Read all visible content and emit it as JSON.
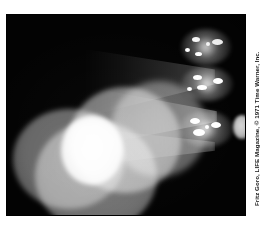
{
  "figure": {
    "name": "additive-color-mixing-photograph",
    "background_color": "#ffffff",
    "photo": {
      "background_color": "#030303",
      "alt_description": "Dark photograph of three overlapping projected light discs forming a bright white core, with converging light beams from three clusters of projector lamps at the right"
    },
    "credit": {
      "text": "Fritz Goro, LIFE Magazine, © 1971 Time Warner, Inc.",
      "orientation": "vertical",
      "color": "#171717"
    },
    "elements": {
      "beams": [
        {
          "name": "beam-top",
          "label": "upper light beam"
        },
        {
          "name": "beam-mid",
          "label": "middle light beam"
        },
        {
          "name": "beam-low",
          "label": "lower light beam"
        }
      ],
      "discs": [
        {
          "name": "disc-left",
          "label": "left projected light disc",
          "tone": "#6e6e6e"
        },
        {
          "name": "disc-bottom",
          "label": "lower projected light disc",
          "tone": "#787878"
        },
        {
          "name": "disc-right",
          "label": "right projected light disc",
          "tone": "#838383"
        },
        {
          "name": "disc-back",
          "label": "background projected light disc",
          "tone": "#6a6a6a"
        },
        {
          "name": "disc-white",
          "label": "central white overlap region",
          "tone": "#fbfbfb"
        }
      ],
      "lamp_clusters": [
        {
          "name": "lamp-cluster-top",
          "label": "upper projector lamp cluster"
        },
        {
          "name": "lamp-cluster-middle",
          "label": "middle projector lamp cluster"
        },
        {
          "name": "lamp-cluster-lower",
          "label": "lower projector lamp cluster"
        }
      ],
      "blob": {
        "name": "blob-right",
        "label": "far right luminous blob"
      }
    }
  }
}
